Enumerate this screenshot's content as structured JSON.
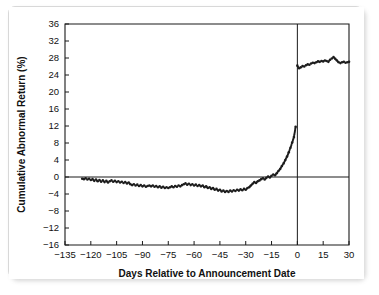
{
  "figure": {
    "background_color": "#ffffff",
    "frame_color": "#d8d8d8",
    "ink_color": "#1a1a1a"
  },
  "chart_data": {
    "type": "scatter",
    "title": "",
    "subtitle": "",
    "xlabel": "Days Relative to Announcement Date",
    "ylabel": "Cumulative Abnormal Return (%)",
    "xlim": [
      -135,
      30
    ],
    "ylim": [
      -16,
      36
    ],
    "xticks": [
      -135,
      -120,
      -105,
      -90,
      -75,
      -60,
      -45,
      -30,
      -15,
      0,
      15,
      30
    ],
    "xtick_labels": [
      "−135",
      "−120",
      "−105",
      "−90",
      "−75",
      "−60",
      "−45",
      "−30",
      "−15",
      "0",
      "15",
      "30"
    ],
    "yticks": [
      -16,
      -12,
      -8,
      -4,
      0,
      4,
      8,
      12,
      16,
      20,
      24,
      28,
      32,
      36
    ],
    "ytick_labels": [
      "−16",
      "−12",
      "−8",
      "−4",
      "0",
      "4",
      "8",
      "12",
      "16",
      "20",
      "24",
      "28",
      "32",
      "36"
    ],
    "grid": false,
    "legend": null,
    "legend_position": "none",
    "annotations": [
      {
        "name": "zero-reference-line",
        "kind": "hline",
        "y": 0
      },
      {
        "name": "announcement-date-line",
        "kind": "vline",
        "x": 0
      }
    ],
    "marker": "dot",
    "marker_size": 1.3,
    "series": [
      {
        "name": "Cumulative abnormal return (pre-announcement)",
        "x": [
          -125,
          -124,
          -123,
          -122,
          -121,
          -120,
          -119,
          -118,
          -117,
          -116,
          -115,
          -114,
          -113,
          -112,
          -111,
          -110,
          -109,
          -108,
          -107,
          -106,
          -105,
          -104,
          -103,
          -102,
          -101,
          -100,
          -99,
          -98,
          -97,
          -96,
          -95,
          -94,
          -93,
          -92,
          -91,
          -90,
          -89,
          -88,
          -87,
          -86,
          -85,
          -84,
          -83,
          -82,
          -81,
          -80,
          -79,
          -78,
          -77,
          -76,
          -75,
          -74,
          -73,
          -72,
          -71,
          -70,
          -69,
          -68,
          -67,
          -66,
          -65,
          -64,
          -63,
          -62,
          -61,
          -60,
          -59,
          -58,
          -57,
          -56,
          -55,
          -54,
          -53,
          -52,
          -51,
          -50,
          -49,
          -48,
          -47,
          -46,
          -45,
          -44,
          -43,
          -42,
          -41,
          -40,
          -39,
          -38,
          -37,
          -36,
          -35,
          -34,
          -33,
          -32,
          -31,
          -30,
          -29,
          -28,
          -27,
          -26,
          -25,
          -24,
          -23,
          -22,
          -21,
          -20,
          -19,
          -18,
          -17,
          -16,
          -15,
          -14,
          -13,
          -12,
          -11,
          -10,
          -9,
          -8,
          -7,
          -6,
          -5,
          -4,
          -3,
          -2,
          -1
        ],
        "y": [
          -0.4,
          -0.5,
          -0.3,
          -0.6,
          -0.4,
          -0.7,
          -0.5,
          -0.9,
          -0.6,
          -1.0,
          -0.7,
          -1.1,
          -0.8,
          -1.2,
          -0.9,
          -1.3,
          -1.0,
          -0.8,
          -1.1,
          -0.9,
          -1.2,
          -1.0,
          -1.3,
          -1.1,
          -1.4,
          -1.2,
          -1.5,
          -1.3,
          -1.7,
          -1.9,
          -1.7,
          -2.0,
          -1.8,
          -2.1,
          -1.9,
          -2.2,
          -2.0,
          -2.3,
          -2.1,
          -2.0,
          -2.2,
          -2.0,
          -2.3,
          -2.1,
          -2.4,
          -2.2,
          -2.5,
          -2.3,
          -2.6,
          -2.4,
          -2.6,
          -2.4,
          -2.2,
          -2.4,
          -2.1,
          -2.3,
          -2.0,
          -2.2,
          -1.9,
          -1.7,
          -1.5,
          -1.8,
          -1.6,
          -1.9,
          -1.7,
          -2.0,
          -1.8,
          -2.1,
          -1.9,
          -2.2,
          -2.0,
          -2.4,
          -2.2,
          -2.6,
          -2.4,
          -2.8,
          -2.6,
          -3.0,
          -2.8,
          -3.2,
          -3.0,
          -3.4,
          -3.2,
          -3.5,
          -3.3,
          -3.5,
          -3.2,
          -3.4,
          -3.1,
          -3.3,
          -3.0,
          -3.2,
          -2.9,
          -3.1,
          -2.8,
          -3.0,
          -2.6,
          -2.4,
          -2.0,
          -1.6,
          -1.2,
          -1.4,
          -1.0,
          -0.8,
          -0.5,
          -0.3,
          -0.6,
          -0.2,
          0.1,
          -0.1,
          0.3,
          0.6,
          0.4,
          0.9,
          1.4,
          1.9,
          2.6,
          3.2,
          4.0,
          4.8,
          5.8,
          6.9,
          8.1,
          9.4,
          11.8
        ]
      },
      {
        "name": "Cumulative abnormal return (post-announcement)",
        "x": [
          0,
          1,
          2,
          3,
          4,
          5,
          6,
          7,
          8,
          9,
          10,
          11,
          12,
          13,
          14,
          15,
          16,
          17,
          18,
          19,
          20,
          21,
          22,
          23,
          24,
          25,
          26,
          27,
          28,
          29,
          30
        ],
        "y": [
          26.2,
          25.6,
          25.8,
          26.1,
          26.0,
          26.3,
          26.5,
          26.4,
          26.7,
          26.9,
          26.8,
          27.0,
          27.2,
          27.1,
          27.3,
          27.2,
          27.4,
          27.3,
          27.1,
          27.6,
          27.9,
          28.2,
          27.8,
          27.4,
          27.0,
          26.8,
          27.0,
          27.1,
          26.9,
          27.0,
          27.1
        ]
      }
    ]
  }
}
